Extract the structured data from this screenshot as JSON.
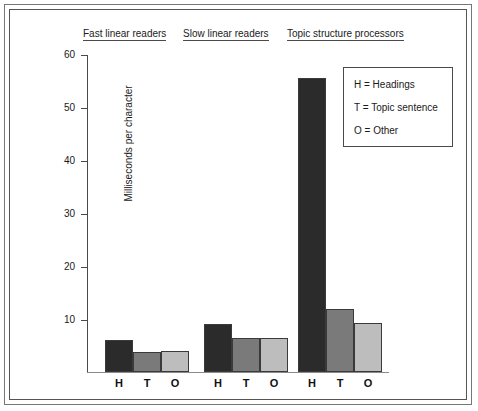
{
  "chart_data": {
    "type": "bar",
    "title": "",
    "xlabel": "",
    "ylabel": "Milliseconds per character",
    "ylim": [
      0,
      60
    ],
    "yticks": [
      10,
      20,
      30,
      40,
      50,
      60
    ],
    "ytick_labels": [
      "10",
      "20",
      "30",
      "40",
      "50",
      "60"
    ],
    "grid": false,
    "legend_position": "top-right",
    "categories": [
      "H",
      "T",
      "O"
    ],
    "category_labels": [
      "H",
      "T",
      "O"
    ],
    "groups": [
      {
        "name": "Fast linear readers",
        "heading": "Fast linear readers",
        "values": [
          6,
          3.8,
          3.9
        ]
      },
      {
        "name": "Slow linear readers",
        "heading": "Slow linear readers",
        "values": [
          9,
          6.5,
          6.5
        ]
      },
      {
        "name": "Topic structure processors",
        "heading": "Topic structure processors",
        "values": [
          55.5,
          11.8,
          9.2
        ]
      }
    ],
    "series": [
      {
        "name": "H",
        "label": "Headings",
        "color": "#2b2b2b",
        "values": [
          6,
          9,
          55.5
        ]
      },
      {
        "name": "T",
        "label": "Topic sentence",
        "color": "#7a7a7a",
        "values": [
          3.8,
          6.5,
          11.8
        ]
      },
      {
        "name": "O",
        "label": "Other",
        "color": "#bdbdbd",
        "values": [
          3.9,
          6.5,
          9.2
        ]
      }
    ],
    "legend": {
      "entries": [
        {
          "key": "H",
          "separator": "=",
          "label": "Headings",
          "text": "H  =  Headings"
        },
        {
          "key": "T",
          "separator": "=",
          "label": "Topic sentence",
          "text": "T  =  Topic sentence"
        },
        {
          "key": "O",
          "separator": "=",
          "label": "Other",
          "text": "O  =  Other"
        }
      ]
    }
  },
  "colors": {
    "series_h": "#2b2b2b",
    "series_t": "#7a7a7a",
    "series_o": "#bdbdbd",
    "axis": "#4a4a4a",
    "frame_outer": "#777777",
    "frame_inner": "#555555",
    "text": "#1a1a1a",
    "background": "#ffffff"
  }
}
